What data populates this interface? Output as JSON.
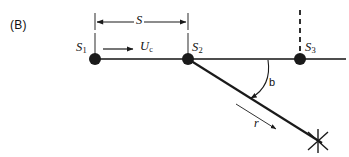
{
  "figure": {
    "panel_label": "(B)",
    "colors": {
      "ink": "#1a1a1a",
      "line": "#4d4d4d",
      "background": "#ffffff"
    },
    "points": [
      {
        "id": "s1",
        "label": "S",
        "subscript": "1",
        "x": 95,
        "y": 59
      },
      {
        "id": "s2",
        "label": "S",
        "subscript": "2",
        "x": 188,
        "y": 59
      },
      {
        "id": "s3",
        "label": "S",
        "subscript": "3",
        "x": 300,
        "y": 59
      }
    ],
    "dimension": {
      "label": "S",
      "from_x": 95,
      "to_x": 188,
      "y": 22
    },
    "velocity": {
      "label": "U",
      "subscript": "c",
      "arrow_from_x": 103,
      "arrow_to_x": 133,
      "y": 49
    },
    "angle": {
      "label": "b",
      "degrees": 32,
      "vertex_x": 188,
      "vertex_y": 59
    },
    "ray": {
      "label": "r",
      "from_x": 188,
      "from_y": 59,
      "to_x": 320,
      "to_y": 142
    },
    "terminator": {
      "name": "cross-mark",
      "x": 318,
      "y": 141
    },
    "baseline": {
      "from_x": 95,
      "to_x": 346,
      "y": 59
    },
    "dashed_normal": {
      "x": 300,
      "from_y": 10,
      "to_y": 55
    }
  }
}
